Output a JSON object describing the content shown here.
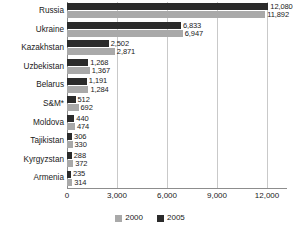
{
  "chart_data": {
    "type": "bar",
    "orientation": "horizontal",
    "title": "",
    "subtitle": "",
    "xlabel": "",
    "ylabel": "",
    "categories": [
      "Russia",
      "Ukraine",
      "Kazakhstan",
      "Uzbekistan",
      "Belarus",
      "S&M*",
      "Moldova",
      "Tajikistan",
      "Kyrgyzstan",
      "Armenia"
    ],
    "series": [
      {
        "name": "2005",
        "color": "#2b2b2b",
        "values": [
          12080,
          6833,
          2502,
          1268,
          1191,
          512,
          440,
          306,
          288,
          235
        ],
        "labels": [
          "12,080",
          "6,833",
          "2,502",
          "1,268",
          "1,191",
          "512",
          "440",
          "306",
          "288",
          "235"
        ]
      },
      {
        "name": "2000",
        "color": "#a9a9a9",
        "values": [
          11892,
          6947,
          2871,
          1367,
          1284,
          692,
          474,
          330,
          372,
          314
        ],
        "labels": [
          "11,892",
          "6,947",
          "2,871",
          "1,367",
          "1,284",
          "692",
          "474",
          "330",
          "372",
          "314"
        ]
      }
    ],
    "xlim": [
      0,
      13200
    ],
    "xticks": [
      0,
      3000,
      6000,
      9000,
      12000
    ],
    "xtick_labels": [
      "0",
      "3,000",
      "6,000",
      "9,000",
      "12,000"
    ],
    "grid": "vertical",
    "legend_position": "bottom",
    "legend": [
      {
        "label": "2000",
        "color": "#a9a9a9"
      },
      {
        "label": "2005",
        "color": "#2b2b2b"
      }
    ]
  }
}
